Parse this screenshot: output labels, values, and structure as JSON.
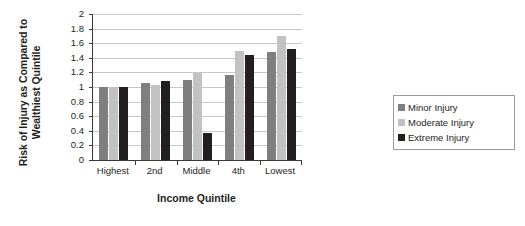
{
  "chart_data": {
    "type": "bar",
    "title": "",
    "subtitle": "",
    "xlabel": "Income Quintile",
    "ylabel": "Risk of Injury as Compared to Wealthiest Quintile",
    "ylabel_line1": "Risk of Injury as Compared to",
    "ylabel_line2": "Wealthiest Quintile",
    "categories": [
      "Highest",
      "2nd",
      "Middle",
      "4th",
      "Lowest"
    ],
    "series": [
      {
        "name": "Minor Injury",
        "color": "#7f7f7f",
        "values": [
          1.0,
          1.05,
          1.1,
          1.16,
          1.48
        ]
      },
      {
        "name": "Moderate Injury",
        "color": "#c2c2c2",
        "values": [
          1.0,
          1.03,
          1.19,
          1.49,
          1.7
        ]
      },
      {
        "name": "Extreme Injury",
        "color": "#231f20",
        "values": [
          1.0,
          1.08,
          0.37,
          1.44,
          1.52
        ]
      }
    ],
    "ylim": [
      0,
      2
    ],
    "ytick_labels": [
      "0",
      "0.2",
      "0.4",
      "0.6",
      "0.8",
      "1",
      "1.2",
      "1.4",
      "1.6",
      "1.8",
      "2"
    ],
    "ytick_values": [
      0,
      0.2,
      0.4,
      0.6,
      0.8,
      1,
      1.2,
      1.4,
      1.6,
      1.8,
      2
    ],
    "grid": true,
    "grid_axis": "y",
    "legend_position": "right",
    "legend_entries": [
      "Minor Injury",
      "Moderate Injury",
      "Extreme Injury"
    ]
  }
}
